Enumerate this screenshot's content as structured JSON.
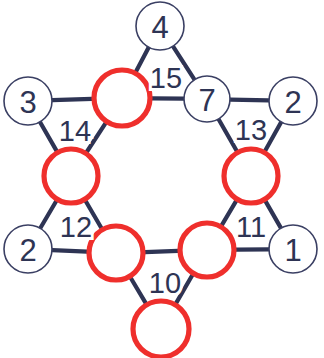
{
  "diagram": {
    "type": "graph",
    "title": "",
    "colors": {
      "node_stroke_plain": "#3a3f63",
      "node_stroke_marked": "#ef2f2c",
      "node_fill": "#ffffff",
      "edge": "#2e3454",
      "text": "#2e3454",
      "background": "#ffffff"
    },
    "nodes": [
      {
        "id": "n4",
        "label": "4",
        "marked": false,
        "cx": 160,
        "cy": 26,
        "r": 24
      },
      {
        "id": "n3",
        "label": "3",
        "marked": false,
        "cx": 28,
        "cy": 101,
        "r": 24
      },
      {
        "id": "n7",
        "label": "7",
        "marked": false,
        "cx": 207,
        "cy": 99,
        "r": 23
      },
      {
        "id": "n2r",
        "label": "2",
        "marked": false,
        "cx": 293,
        "cy": 101,
        "r": 24
      },
      {
        "id": "n2l",
        "label": "2",
        "marked": false,
        "cx": 28,
        "cy": 249,
        "r": 24
      },
      {
        "id": "n1",
        "label": "1",
        "marked": false,
        "cx": 293,
        "cy": 249,
        "r": 24
      },
      {
        "id": "m_top",
        "label": "",
        "marked": true,
        "cx": 122,
        "cy": 98,
        "r": 28
      },
      {
        "id": "m_left",
        "label": "",
        "marked": true,
        "cx": 71,
        "cy": 176,
        "r": 27
      },
      {
        "id": "m_right",
        "label": "",
        "marked": true,
        "cx": 251,
        "cy": 176,
        "r": 27
      },
      {
        "id": "m_bleft",
        "label": "",
        "marked": true,
        "cx": 116,
        "cy": 253,
        "r": 27
      },
      {
        "id": "m_bright",
        "label": "",
        "marked": true,
        "cx": 207,
        "cy": 250,
        "r": 27
      },
      {
        "id": "m_bottom",
        "label": "",
        "marked": true,
        "cx": 161,
        "cy": 329,
        "r": 28
      }
    ],
    "edges": [
      {
        "from": "n4",
        "to": "m_top"
      },
      {
        "from": "n4",
        "to": "n7"
      },
      {
        "from": "m_top",
        "to": "n7"
      },
      {
        "from": "n3",
        "to": "m_top"
      },
      {
        "from": "n3",
        "to": "m_left"
      },
      {
        "from": "m_top",
        "to": "m_left"
      },
      {
        "from": "n7",
        "to": "n2r"
      },
      {
        "from": "n7",
        "to": "m_right"
      },
      {
        "from": "n2r",
        "to": "m_right"
      },
      {
        "from": "m_left",
        "to": "n2l"
      },
      {
        "from": "m_left",
        "to": "m_bleft"
      },
      {
        "from": "n2l",
        "to": "m_bleft"
      },
      {
        "from": "m_right",
        "to": "n1"
      },
      {
        "from": "m_right",
        "to": "m_bright"
      },
      {
        "from": "n1",
        "to": "m_bright"
      },
      {
        "from": "m_bleft",
        "to": "m_bright"
      },
      {
        "from": "m_bleft",
        "to": "m_bottom"
      },
      {
        "from": "m_bright",
        "to": "m_bottom"
      }
    ],
    "edge_labels": [
      {
        "id": "lbl15",
        "text": "15",
        "x": 166,
        "y": 78
      },
      {
        "id": "lbl14",
        "text": "14",
        "x": 75,
        "y": 131
      },
      {
        "id": "lbl13",
        "text": "13",
        "x": 251,
        "y": 130
      },
      {
        "id": "lbl12",
        "text": "12",
        "x": 76,
        "y": 227
      },
      {
        "id": "lbl11",
        "text": "11",
        "x": 251,
        "y": 227
      },
      {
        "id": "lbl10",
        "text": "10",
        "x": 165,
        "y": 283
      }
    ]
  }
}
